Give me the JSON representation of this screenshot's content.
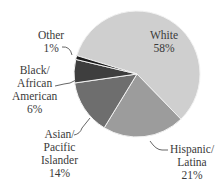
{
  "chart_data": {
    "type": "pie",
    "title": "",
    "categories": [
      "White",
      "Hispanic/Latina",
      "Asian/Pacific Islander",
      "Black/African American",
      "Other"
    ],
    "values": [
      58,
      21,
      14,
      6,
      1
    ],
    "unit": "%",
    "colors": [
      "#cfcfcf",
      "#9c9c9c",
      "#6e6e6e",
      "#3e3e3e",
      "#1c1c1c"
    ],
    "start_angle_deg": 287,
    "direction": "clockwise",
    "legend": "none (direct labels with leader lines)"
  },
  "labels": {
    "white": {
      "lines": [
        "White",
        "58%"
      ]
    },
    "hispanic": {
      "lines": [
        "Hispanic/",
        "Latina",
        "21%"
      ]
    },
    "asian": {
      "lines": [
        "Asian/",
        "Pacific",
        "Islander",
        "14%"
      ]
    },
    "black": {
      "lines": [
        "Black/",
        "African",
        "American",
        "6%"
      ]
    },
    "other": {
      "lines": [
        "Other",
        "1%"
      ]
    }
  }
}
